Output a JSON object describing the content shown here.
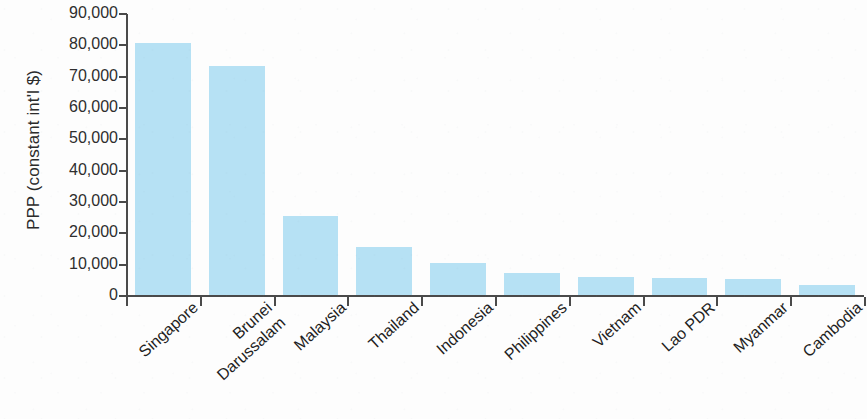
{
  "chart_data": {
    "type": "bar",
    "title": "",
    "subtitle": "",
    "xlabel": "",
    "ylabel": "PPP (constant int'l $)",
    "categories": [
      "Singapore",
      "Brunei Darussalam",
      "Malaysia",
      "Thailand",
      "Indonesia",
      "Philippines",
      "Vietnam",
      "Lao PDR",
      "Myanmar",
      "Cambodia"
    ],
    "category_lines": [
      [
        "Singapore"
      ],
      [
        "Brunei",
        "Darussalam"
      ],
      [
        "Malaysia"
      ],
      [
        "Thailand"
      ],
      [
        "Indonesia"
      ],
      [
        "Philippines"
      ],
      [
        "Vietnam"
      ],
      [
        "Lao PDR"
      ],
      [
        "Myanmar"
      ],
      [
        "Cambodia"
      ]
    ],
    "values": [
      80400,
      73000,
      25300,
      15200,
      10200,
      7000,
      5800,
      5400,
      5000,
      3300
    ],
    "ylim": [
      0,
      90000
    ],
    "yticks": [
      0,
      10000,
      20000,
      30000,
      40000,
      50000,
      60000,
      70000,
      80000,
      90000
    ],
    "ytick_labels": [
      "0",
      "10,000",
      "20,000",
      "30,000",
      "40,000",
      "50,000",
      "60,000",
      "70,000",
      "80,000",
      "90,000"
    ],
    "grid": false,
    "legend": false,
    "legend_position": "none",
    "bar_color": "#b6e1f4",
    "axis_color": "#4a4a4a",
    "text_color": "#1f1f1f",
    "label_rotation_deg": -42
  }
}
